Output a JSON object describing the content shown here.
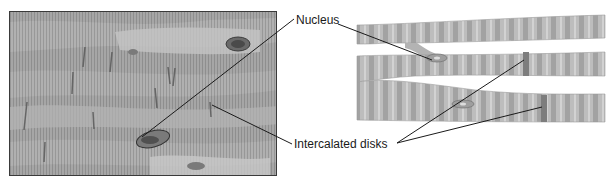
{
  "figure": {
    "photo": {
      "description": "Light micrograph of cardiac muscle showing striated branching fibers"
    },
    "drawing": {
      "description": "Illustration of branching striated cardiac muscle fibers"
    },
    "labels": {
      "nucleus": "Nucleus",
      "intercalated_disks": "Intercalated disks"
    },
    "colors": {
      "line": "#1a1a1a",
      "fiber": "#b9b9b9",
      "fiber_dark": "#959595",
      "disk": "#7a7a7a",
      "photo_bg": "#a9a9a9"
    }
  }
}
